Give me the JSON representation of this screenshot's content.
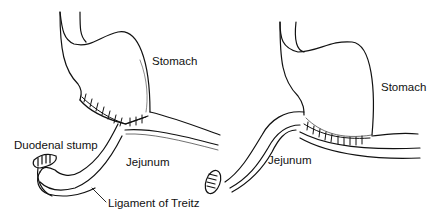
{
  "figure": {
    "panels": [
      {
        "id": "left",
        "labels": {
          "stomach": "Stomach",
          "duodenal_stump": "Duodenal stump",
          "jejunum": "Jejunum",
          "ligament": "Ligament of Treitz"
        }
      },
      {
        "id": "right",
        "labels": {
          "stomach": "Stomach",
          "jejunum": "Jejunum"
        }
      }
    ],
    "colors": {
      "line": "#111111",
      "background": "#ffffff"
    }
  }
}
